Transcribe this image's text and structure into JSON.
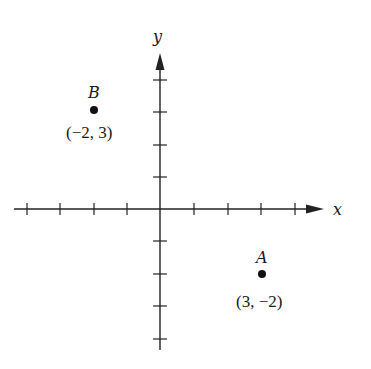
{
  "diagram": {
    "type": "coordinate-plane",
    "x_axis_label": "x",
    "y_axis_label": "y",
    "x_ticks": [
      -4,
      -3,
      -2,
      -1,
      1,
      2,
      3,
      4
    ],
    "y_ticks": [
      4,
      3,
      2,
      1,
      -1,
      -2,
      -3,
      -4
    ],
    "points": [
      {
        "name": "B",
        "x": -2,
        "y": 3,
        "label": "(−2, 3)"
      },
      {
        "name": "A",
        "x": 3,
        "y": -2,
        "label": "(3, −2)"
      }
    ],
    "colors": {
      "ink": "#222222",
      "background": "#ffffff"
    }
  }
}
